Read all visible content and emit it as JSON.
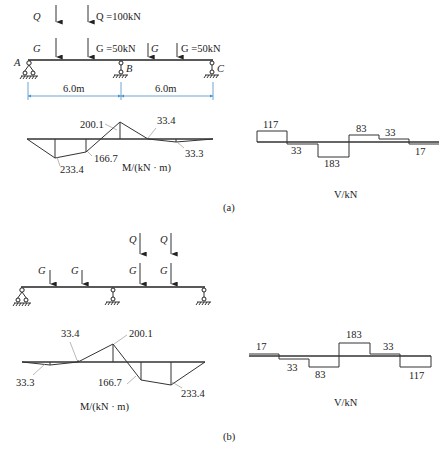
{
  "panel_a": {
    "caption": "(a)",
    "loads": {
      "Q_label": "Q",
      "Q_value_label": "Q =100kN",
      "G_label": "G",
      "G_value_label_1": "G =50kN",
      "G_label_2": "G",
      "G_value_label_2": "G =50kN"
    },
    "supports": {
      "A": "A",
      "B": "B",
      "C": "C"
    },
    "spans": [
      "6.0m",
      "6.0m"
    ],
    "moment": {
      "unit_label": "M/(kN · m)",
      "values": [
        "233.4",
        "166.7",
        "200.1",
        "33.4",
        "33.3"
      ]
    },
    "shear": {
      "unit_label": "V/kN",
      "values": [
        "117",
        "33",
        "183",
        "83",
        "33",
        "17"
      ]
    }
  },
  "panel_b": {
    "caption": "(b)",
    "loads": {
      "G1": "G",
      "G2": "G",
      "G3": "G",
      "G4": "G",
      "Q1": "Q",
      "Q2": "Q"
    },
    "moment": {
      "unit_label": "M/(kN · m)",
      "values": [
        "33.3",
        "33.4",
        "200.1",
        "166.7",
        "233.4"
      ]
    },
    "shear": {
      "unit_label": "V/kN",
      "values": [
        "17",
        "33",
        "83",
        "183",
        "33",
        "117"
      ]
    }
  }
}
